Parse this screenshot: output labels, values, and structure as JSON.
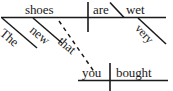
{
  "diagram": {
    "type": "reed-kellogg-sentence-diagram",
    "sentence": "The new shoes that you bought are very wet.",
    "ink_color": "#1a1a1a",
    "background_color": "#ffffff",
    "main_clause": {
      "subject": "shoes",
      "verb": "are",
      "predicate_adjective": "wet",
      "subject_modifiers": [
        "The",
        "new"
      ],
      "predicate_adjective_modifier": "very"
    },
    "relative_clause": {
      "relative_pronoun": "that",
      "subject": "you",
      "verb": "bought",
      "connector_style": "dashed"
    },
    "words": {
      "the": "The",
      "new": "new",
      "shoes": "shoes",
      "that": "that",
      "you": "you",
      "bought": "bought",
      "are": "are",
      "very": "very",
      "wet": "wet"
    }
  }
}
